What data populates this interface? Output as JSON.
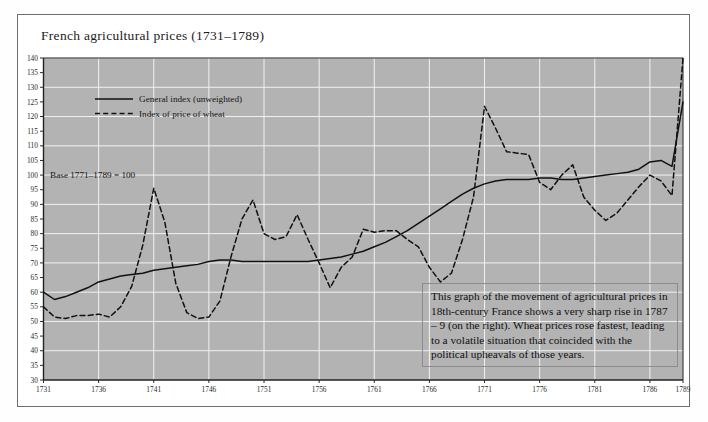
{
  "figure": {
    "title": "French agricultural prices (1731–1789)",
    "caption": "This graph of the movement of agricultural prices in 18th-century France shows a very sharp rise in 1787 – 9 (on the right). Wheat prices rose fastest, leading to a volatile situation that coincided with the political upheavals of those years.",
    "base_note": "Base 1771–1789 = 100",
    "plot_bg": "#b3b3b3",
    "grid_color": "#f2f2f2",
    "line_color": "#111111",
    "axis_color": "#2b2b2b"
  },
  "chart_data": {
    "type": "line",
    "title": "French agricultural prices (1731–1789)",
    "xlabel": "",
    "ylabel": "",
    "xlim": [
      1731,
      1789
    ],
    "ylim": [
      30,
      140
    ],
    "ytick_step": 5,
    "yticks": [
      30,
      35,
      40,
      45,
      50,
      55,
      60,
      65,
      70,
      75,
      80,
      85,
      90,
      95,
      100,
      105,
      110,
      115,
      120,
      125,
      130,
      135,
      140
    ],
    "xticks": [
      1731,
      1736,
      1741,
      1746,
      1751,
      1756,
      1761,
      1766,
      1771,
      1776,
      1781,
      1786,
      1789
    ],
    "grid": true,
    "grid_y_step": 10,
    "grid_x_step": 5,
    "legend_position": "upper-left",
    "annotations": [
      {
        "text": "Base 1771–1789 = 100",
        "x": 1731.6,
        "y": 100
      }
    ],
    "x": [
      1731,
      1732,
      1733,
      1734,
      1735,
      1736,
      1737,
      1738,
      1739,
      1740,
      1741,
      1742,
      1743,
      1744,
      1745,
      1746,
      1747,
      1748,
      1749,
      1750,
      1751,
      1752,
      1753,
      1754,
      1755,
      1756,
      1757,
      1758,
      1759,
      1760,
      1761,
      1762,
      1763,
      1764,
      1765,
      1766,
      1767,
      1768,
      1769,
      1770,
      1771,
      1772,
      1773,
      1774,
      1775,
      1776,
      1777,
      1778,
      1779,
      1780,
      1781,
      1782,
      1783,
      1784,
      1785,
      1786,
      1787,
      1788,
      1789
    ],
    "series": [
      {
        "name": "General index (unweighted)",
        "style": "solid",
        "values": [
          60,
          57.5,
          58.5,
          60,
          61.5,
          63.5,
          64.5,
          65.5,
          66,
          66.5,
          67.5,
          68,
          68.5,
          69,
          69.5,
          70.5,
          71,
          71,
          70.5,
          70.5,
          70.5,
          70.5,
          70.5,
          70.5,
          70.5,
          71,
          71.5,
          72,
          73,
          74,
          75.5,
          77,
          79,
          81,
          83.5,
          86,
          88.5,
          91,
          93.5,
          95.5,
          97,
          98,
          98.5,
          98.5,
          98.5,
          99,
          99,
          98.5,
          98.5,
          99,
          99.5,
          100,
          100.5,
          101,
          102,
          104.5,
          105,
          103,
          125
        ]
      },
      {
        "name": "Index of price of wheat",
        "style": "dashed",
        "values": [
          55,
          51.5,
          51,
          52,
          52,
          52.5,
          51.5,
          55,
          62,
          76,
          95.5,
          84,
          63,
          53,
          51,
          51.5,
          57,
          72,
          85,
          91.5,
          80,
          78,
          79,
          86.5,
          78,
          70,
          61.5,
          68.5,
          72,
          81.5,
          80.5,
          81,
          81,
          78,
          75.5,
          68.5,
          63.5,
          66.5,
          78,
          92.5,
          123.5,
          116,
          108,
          107.5,
          107,
          97.5,
          95,
          100,
          103.5,
          92.5,
          88,
          84.5,
          87,
          91.5,
          96,
          100,
          98,
          93,
          140
        ]
      }
    ]
  },
  "legend": [
    {
      "label": "General index (unweighted)",
      "style": "solid"
    },
    {
      "label": "Index of price of wheat",
      "style": "dashed"
    }
  ]
}
